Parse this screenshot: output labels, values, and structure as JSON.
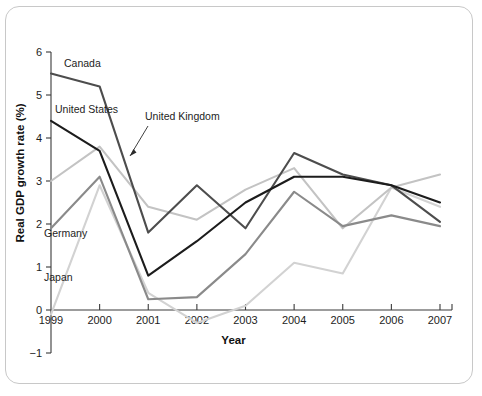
{
  "figure": {
    "frame_visible": true,
    "background": "#ffffff"
  },
  "chart_data": {
    "type": "line",
    "title": "",
    "xlabel": "Year",
    "ylabel": "Real GDP growth rate (%)",
    "x": [
      1999,
      2000,
      2001,
      2002,
      2003,
      2004,
      2005,
      2006,
      2007
    ],
    "categories": [
      "1999",
      "2000",
      "2001",
      "2002",
      "2003",
      "2004",
      "2005",
      "2006",
      "2007"
    ],
    "xlim": [
      1999,
      2007
    ],
    "ylim": [
      -1,
      6
    ],
    "yticks": [
      -1,
      0,
      1,
      2,
      3,
      4,
      5,
      6
    ],
    "ytick_labels": [
      "−1",
      "0",
      "1",
      "2",
      "3",
      "4",
      "5",
      "6"
    ],
    "grid": false,
    "legend_position": "inline-labels",
    "series": [
      {
        "name": "Canada",
        "color": "#4d4d4d",
        "values": [
          5.5,
          5.2,
          1.8,
          2.9,
          1.9,
          3.65,
          3.15,
          2.9,
          2.05
        ]
      },
      {
        "name": "United States",
        "color": "#1c1c1c",
        "values": [
          4.4,
          3.7,
          0.8,
          1.6,
          2.5,
          3.1,
          3.1,
          2.9,
          2.5
        ]
      },
      {
        "name": "United Kingdom",
        "color": "#c3c3c3",
        "values": [
          3.0,
          3.8,
          2.4,
          2.1,
          2.8,
          3.3,
          1.9,
          2.85,
          3.15
        ]
      },
      {
        "name": "Germany",
        "color": "#8a8a8a",
        "values": [
          1.9,
          3.1,
          0.25,
          0.3,
          1.3,
          2.75,
          1.95,
          2.2,
          1.95
        ]
      },
      {
        "name": "Japan",
        "color": "#d2d2d2",
        "values": [
          -0.1,
          2.9,
          0.4,
          -0.3,
          0.1,
          1.1,
          0.85,
          2.85,
          2.4
        ]
      }
    ],
    "annotations": [
      {
        "text": "Canada",
        "series": "Canada",
        "x": 64,
        "y": 67,
        "leader": false
      },
      {
        "text": "United States",
        "series": "United States",
        "x": 55,
        "y": 113,
        "leader": false
      },
      {
        "text": "United Kingdom",
        "series": "United Kingdom",
        "x": 145,
        "y": 120,
        "leader": true,
        "leader_from_x": 148,
        "leader_from_y": 126,
        "leader_to_x": 130,
        "leader_to_y": 156
      },
      {
        "text": "Germany",
        "series": "Germany",
        "x": 44,
        "y": 237,
        "leader": false
      },
      {
        "text": "Japan",
        "series": "Japan",
        "x": 44,
        "y": 281,
        "leader": false
      }
    ]
  }
}
